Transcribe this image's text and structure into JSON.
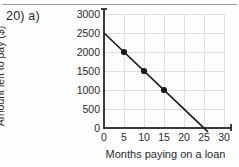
{
  "page": {
    "question_label": "20) a)"
  },
  "chart_data": {
    "type": "line",
    "title": "",
    "xlabel": "Months paying on a loan",
    "ylabel": "Amount left to pay ($)",
    "xlim": [
      0,
      30
    ],
    "ylim": [
      0,
      3000
    ],
    "xticks": [
      0,
      5,
      10,
      15,
      20,
      25,
      30
    ],
    "xtick_labels": [
      "0",
      "5",
      "10",
      "15",
      "20",
      "25",
      "30"
    ],
    "yticks": [
      0,
      500,
      1000,
      1500,
      2000,
      2500,
      3000
    ],
    "ytick_labels": [
      "0",
      "500",
      "1000",
      "1500",
      "2000",
      "2500",
      "3000"
    ],
    "grid": true,
    "legend": "none",
    "line_color": "#1a1a1a",
    "grid_color": "#dedede",
    "axis_color": "#3a3a3a",
    "trend_line": {
      "x": [
        0,
        26
      ],
      "y": [
        2500,
        -100
      ],
      "intercept": 2500,
      "slope": -100
    },
    "markers": {
      "x": [
        5,
        10,
        15
      ],
      "y": [
        2000,
        1500,
        1000
      ]
    },
    "series": [
      {
        "name": "Amount left to pay",
        "x": [
          0,
          5,
          10,
          15,
          25
        ],
        "y": [
          2500,
          2000,
          1500,
          1000,
          0
        ]
      }
    ]
  }
}
